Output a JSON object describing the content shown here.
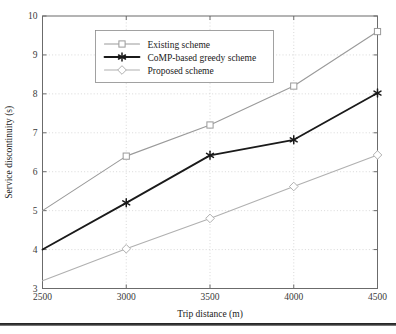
{
  "chart_data": {
    "type": "line",
    "title": "",
    "xlabel": "Trip distance (m)",
    "ylabel": "Service discontinuity (s)",
    "x": [
      2500,
      3000,
      3500,
      4000,
      4500
    ],
    "xtick_labels": [
      "2500",
      "3000",
      "3500",
      "4000",
      "4500"
    ],
    "ytick_labels": [
      "3",
      "4",
      "5",
      "6",
      "7",
      "8",
      "9",
      "10"
    ],
    "yticks": [
      3,
      4,
      5,
      6,
      7,
      8,
      9,
      10
    ],
    "xlim": [
      2500,
      4500
    ],
    "ylim": [
      3,
      10
    ],
    "grid": true,
    "legend_position": "upper left",
    "series": [
      {
        "name": "Existing scheme",
        "values": [
          5.0,
          6.4,
          7.2,
          8.2,
          9.6
        ],
        "color": "#9a9a9a",
        "marker": "square",
        "line_width": 1.1
      },
      {
        "name": "CoMP-based greedy scheme",
        "values": [
          4.0,
          5.2,
          6.42,
          6.82,
          8.02
        ],
        "color": "#1a1a1a",
        "marker": "star",
        "line_width": 1.8
      },
      {
        "name": "Proposed scheme",
        "values": [
          3.2,
          4.02,
          4.8,
          5.62,
          6.43
        ],
        "color": "#b0b0b0",
        "marker": "diamond",
        "line_width": 1.1
      }
    ]
  },
  "legend": {
    "entries": [
      {
        "label": "Existing scheme"
      },
      {
        "label": "CoMP-based greedy scheme"
      },
      {
        "label": "Proposed scheme"
      }
    ]
  },
  "axes": {
    "x_title": "Trip distance (m)",
    "y_title": "Service discontinuity (s)"
  }
}
